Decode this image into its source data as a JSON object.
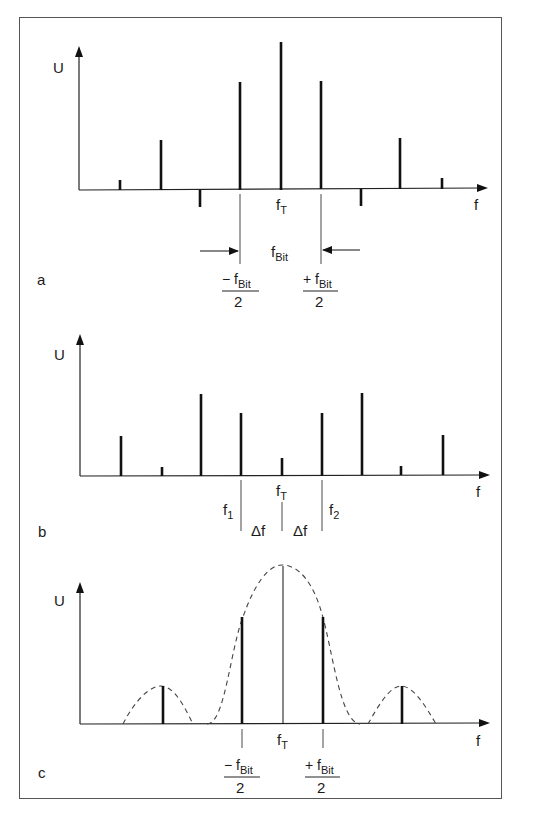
{
  "figure": {
    "panels": [
      {
        "id": "a",
        "panel_label": "a",
        "y_axis_label": "U",
        "x_axis_label": "f",
        "center_label": {
          "base": "f",
          "sub": "T"
        },
        "bandwidth_label": {
          "base": "f",
          "sub": "Bit"
        },
        "left_fraction": {
          "sign": "− f",
          "sub": "Bit",
          "denominator": "2"
        },
        "right_fraction": {
          "sign": "+ f",
          "sub": "Bit",
          "denominator": "2"
        },
        "spectral_lines_relative_amplitude": [
          0.07,
          0.35,
          -0.12,
          0.75,
          1.0,
          0.75,
          -0.12,
          0.36,
          0.08
        ]
      },
      {
        "id": "b",
        "panel_label": "b",
        "y_axis_label": "U",
        "x_axis_label": "f",
        "center_label": {
          "base": "f",
          "sub": "T"
        },
        "f1_label": {
          "base": "f",
          "sub": "1"
        },
        "f2_label": {
          "base": "f",
          "sub": "2"
        },
        "delta_label": "Δf",
        "spectral_lines_relative_amplitude": [
          0.28,
          0.06,
          0.57,
          0.44,
          0.12,
          0.44,
          0.58,
          0.07,
          0.29
        ]
      },
      {
        "id": "c",
        "panel_label": "c",
        "y_axis_label": "U",
        "x_axis_label": "f",
        "center_label": {
          "base": "f",
          "sub": "T"
        },
        "left_fraction": {
          "sign": "− f",
          "sub": "Bit",
          "denominator": "2"
        },
        "right_fraction": {
          "sign": "+ f",
          "sub": "Bit",
          "denominator": "2"
        },
        "envelope": "dashed sinc-like envelope",
        "spectral_lines_relative_amplitude": [
          0.24,
          0.67,
          1.0,
          0.67,
          0.24
        ]
      }
    ]
  }
}
